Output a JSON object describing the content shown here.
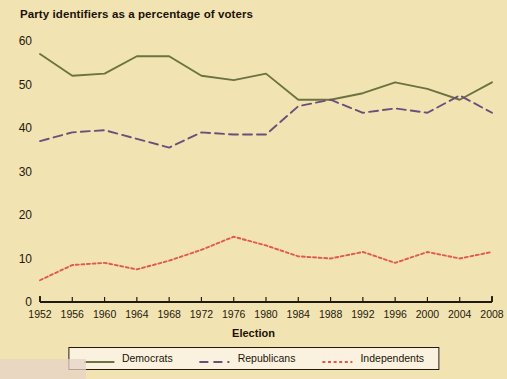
{
  "chart_data": {
    "type": "line",
    "title": "Party identifiers as a percentage of voters",
    "xlabel": "Election",
    "ylabel": "",
    "xlim": [
      1952,
      2008
    ],
    "ylim": [
      0,
      60
    ],
    "grid": false,
    "legend_position": "bottom",
    "categories": [
      "1952",
      "1956",
      "1960",
      "1964",
      "1968",
      "1972",
      "1976",
      "1980",
      "1984",
      "1988",
      "1992",
      "1996",
      "2000",
      "2004",
      "2008"
    ],
    "x": [
      1952,
      1956,
      1960,
      1964,
      1968,
      1972,
      1976,
      1980,
      1984,
      1988,
      1992,
      1996,
      2000,
      2004,
      2008
    ],
    "yticks": [
      0,
      10,
      20,
      30,
      40,
      50,
      60
    ],
    "xticks": [
      1952,
      1956,
      1960,
      1964,
      1968,
      1972,
      1976,
      1980,
      1984,
      1988,
      1992,
      1996,
      2000,
      2004,
      2008
    ],
    "series": [
      {
        "name": "Democrats",
        "style": "solid",
        "color": "#6b7340",
        "values": [
          57,
          52,
          52.5,
          56.5,
          56.5,
          52,
          51,
          52.5,
          46.5,
          46.5,
          48,
          50.5,
          49,
          46.5,
          50.5
        ]
      },
      {
        "name": "Republicans",
        "style": "dashed",
        "color": "#6b4f7a",
        "values": [
          37,
          39,
          39.5,
          37.5,
          35.5,
          39,
          38.5,
          38.5,
          45,
          46.5,
          43.5,
          44.5,
          43.5,
          47.5,
          43.5
        ]
      },
      {
        "name": "Independents",
        "style": "dotted",
        "color": "#e05a53",
        "values": [
          5,
          8.5,
          9,
          7.5,
          9.5,
          12,
          15,
          13,
          10.5,
          10,
          11.5,
          9,
          11.5,
          10,
          11.5
        ]
      }
    ]
  },
  "legend": {
    "entries": [
      {
        "label": "Democrats"
      },
      {
        "label": "Republicans"
      },
      {
        "label": "Independents"
      }
    ]
  },
  "colors": {
    "background": "#f2e3b3",
    "democrats": "#6b7340",
    "republicans": "#6b4f7a",
    "independents": "#e05a53",
    "axis": "#231a0e",
    "text": "#1a1208"
  }
}
